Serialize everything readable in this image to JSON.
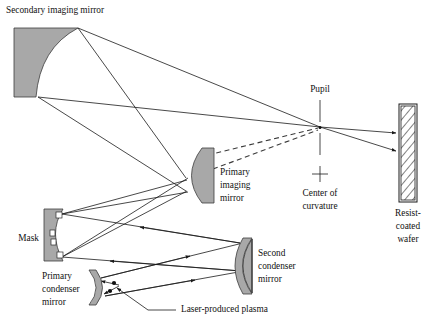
{
  "figure": {
    "width": 433,
    "height": 333,
    "background": "#ffffff",
    "mirror_fill": "#a8a8a8",
    "line_color": "#1a1a1a"
  },
  "labels": {
    "secondary_imaging_mirror": "Secondary imaging mirror",
    "primary_imaging_mirror_line1": "Primary",
    "primary_imaging_mirror_line2": "imaging",
    "primary_imaging_mirror_line3": "mirror",
    "pupil": "Pupil",
    "center_of_curvature_line1": "Center of",
    "center_of_curvature_line2": "curvature",
    "resist_coated_wafer_line1": "Resist-",
    "resist_coated_wafer_line2": "coated",
    "resist_coated_wafer_line3": "wafer",
    "mask": "Mask",
    "second_condenser_mirror_line1": "Second",
    "second_condenser_mirror_line2": "condenser",
    "second_condenser_mirror_line3": "mirror",
    "primary_condenser_mirror_line1": "Primary",
    "primary_condenser_mirror_line2": "condenser",
    "primary_condenser_mirror_line3": "mirror",
    "laser_produced_plasma": "Laser-produced plasma"
  },
  "components": [
    {
      "id": "secondary-imaging-mirror",
      "kind": "concave-mirror",
      "label": "Secondary imaging mirror"
    },
    {
      "id": "primary-imaging-mirror",
      "kind": "convex-d-mirror",
      "label": "Primary imaging mirror"
    },
    {
      "id": "mask",
      "kind": "reflective-mask",
      "label": "Mask"
    },
    {
      "id": "primary-condenser-mirror",
      "kind": "crescent-mirror",
      "label": "Primary condenser mirror"
    },
    {
      "id": "second-condenser-mirror",
      "kind": "crescent-mirror",
      "label": "Second condenser mirror"
    },
    {
      "id": "resist-coated-wafer",
      "kind": "hatched-slab",
      "label": "Resist-coated wafer"
    },
    {
      "id": "laser-produced-plasma",
      "kind": "point-source",
      "label": "Laser-produced plasma"
    },
    {
      "id": "pupil",
      "kind": "marker-point",
      "label": "Pupil"
    },
    {
      "id": "center-of-curvature",
      "kind": "plus-marker",
      "label": "Center of curvature"
    }
  ]
}
